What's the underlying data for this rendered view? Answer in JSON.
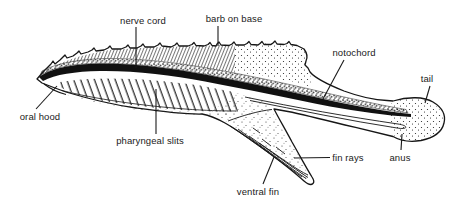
{
  "figure": {
    "background": "#ffffff",
    "ink_color": "#1a1a1a",
    "labels": {
      "nerve_cord": "nerve cord",
      "barb_on_base": "barb on base",
      "notochord": "notochord",
      "tail": "tail",
      "oral_hood": "oral hood",
      "pharyngeal_slits": "pharyngeal slits",
      "fin_rays": "fin rays",
      "anus": "anus",
      "ventral_fin": "ventral fin"
    }
  }
}
